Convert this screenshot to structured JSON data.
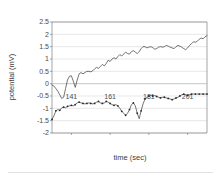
{
  "chart_data": {
    "type": "line",
    "title": "",
    "xlabel": "time (sec)",
    "ylabel": "potential (mV)",
    "xlim": [
      131,
      211
    ],
    "ylim": [
      -2,
      2.5
    ],
    "yticks": [
      2.5,
      2,
      1.5,
      1,
      0.5,
      0,
      -0.5,
      -1,
      -1.5,
      -2
    ],
    "ytick_labels": [
      "2.5",
      "2",
      "1.5",
      "1",
      "0.5",
      "0",
      "-0.5",
      "-1",
      "-1.5",
      "-2"
    ],
    "xticks": [
      141,
      161,
      181,
      201
    ],
    "xtick_labels": [
      "141",
      "161",
      "181",
      "201"
    ],
    "grid": true,
    "legend": "none",
    "series": [
      {
        "name": "upper-trace",
        "markers": false,
        "x": [
          131,
          132,
          133,
          134,
          135,
          136,
          137,
          138,
          139,
          140,
          141,
          142,
          143,
          144,
          145,
          146,
          147,
          148,
          149,
          150,
          151,
          152,
          153,
          154,
          155,
          156,
          157,
          158,
          159,
          160,
          161,
          162,
          163,
          164,
          165,
          166,
          167,
          168,
          169,
          170,
          171,
          172,
          173,
          174,
          175,
          176,
          177,
          178,
          179,
          180,
          181,
          182,
          183,
          184,
          185,
          186,
          187,
          188,
          189,
          190,
          191,
          192,
          193,
          194,
          195,
          196,
          197,
          198,
          199,
          200,
          201,
          202,
          203,
          204,
          205,
          206,
          207,
          208,
          209,
          210,
          211
        ],
        "y": [
          -0.05,
          -0.1,
          -0.2,
          -0.3,
          -0.45,
          -0.6,
          -0.55,
          -0.2,
          0.15,
          0.3,
          0.32,
          0.1,
          -0.15,
          0.15,
          0.4,
          0.45,
          0.4,
          0.45,
          0.5,
          0.5,
          0.48,
          0.52,
          0.6,
          0.66,
          0.62,
          0.7,
          0.78,
          0.72,
          0.82,
          0.95,
          0.9,
          1.0,
          1.05,
          1.0,
          1.1,
          1.18,
          1.12,
          1.2,
          1.28,
          1.22,
          1.2,
          1.3,
          1.34,
          1.28,
          1.22,
          1.3,
          1.42,
          1.5,
          1.5,
          1.45,
          1.48,
          1.5,
          1.46,
          1.4,
          1.42,
          1.48,
          1.5,
          1.48,
          1.5,
          1.55,
          1.52,
          1.48,
          1.45,
          1.42,
          1.5,
          1.55,
          1.52,
          1.48,
          1.42,
          1.38,
          1.45,
          1.55,
          1.62,
          1.7,
          1.68,
          1.72,
          1.8,
          1.85,
          1.82,
          1.9,
          1.95
        ]
      },
      {
        "name": "lower-trace",
        "markers": true,
        "x": [
          131,
          132,
          133,
          134,
          135,
          136,
          137,
          138,
          139,
          140,
          141,
          142,
          143,
          144,
          145,
          146,
          147,
          148,
          149,
          150,
          151,
          152,
          153,
          154,
          155,
          156,
          157,
          158,
          159,
          160,
          161,
          162,
          163,
          164,
          165,
          166,
          167,
          168,
          169,
          170,
          171,
          172,
          173,
          174,
          175,
          176,
          177,
          178,
          179,
          180,
          181,
          182,
          183,
          184,
          185,
          186,
          187,
          188,
          189,
          190,
          191,
          192,
          193,
          194,
          195,
          196,
          197,
          198,
          199,
          200,
          201,
          202,
          203,
          204,
          205,
          206,
          207,
          208,
          209,
          210,
          211
        ],
        "y": [
          -1.45,
          -1.3,
          -1.1,
          -1.05,
          -1.08,
          -0.98,
          -0.95,
          -0.98,
          -0.92,
          -0.9,
          -0.88,
          -0.9,
          -0.85,
          -0.78,
          -0.75,
          -0.78,
          -0.8,
          -0.82,
          -0.8,
          -0.78,
          -0.8,
          -0.82,
          -0.8,
          -0.75,
          -0.72,
          -0.78,
          -0.8,
          -0.78,
          -0.72,
          -0.75,
          -0.8,
          -0.85,
          -0.88,
          -0.85,
          -0.9,
          -1.0,
          -1.12,
          -1.2,
          -1.28,
          -1.2,
          -1.05,
          -0.85,
          -0.78,
          -0.9,
          -1.2,
          -1.42,
          -1.1,
          -0.82,
          -0.62,
          -0.55,
          -0.5,
          -0.48,
          -0.5,
          -0.48,
          -0.52,
          -0.55,
          -0.58,
          -0.55,
          -0.55,
          -0.58,
          -0.6,
          -0.62,
          -0.65,
          -0.62,
          -0.58,
          -0.55,
          -0.5,
          -0.45,
          -0.42,
          -0.45,
          -0.48,
          -0.45,
          -0.42,
          -0.42,
          -0.42,
          -0.42,
          -0.42,
          -0.42,
          -0.42,
          -0.42,
          -0.42
        ]
      }
    ]
  },
  "colors": {
    "line": "#3a3a3a",
    "grid": "#d0d0d0",
    "axis": "#808080",
    "text": "#4a4a4a",
    "background": "#ffffff"
  }
}
